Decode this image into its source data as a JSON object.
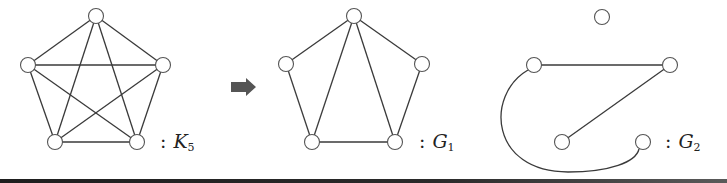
{
  "figure": {
    "graphs": [
      {
        "id": "K5",
        "label": {
          "colon": ":",
          "symbol": "K",
          "subscript": "5"
        },
        "label_pos": [
          160,
          130
        ],
        "nodes": [
          {
            "id": "top",
            "x": 96,
            "y": 16
          },
          {
            "id": "left",
            "x": 28,
            "y": 65
          },
          {
            "id": "right",
            "x": 163,
            "y": 65
          },
          {
            "id": "bottom-left",
            "x": 55,
            "y": 142
          },
          {
            "id": "bottom-right",
            "x": 137,
            "y": 142
          }
        ],
        "edges": [
          [
            "top",
            "left"
          ],
          [
            "top",
            "right"
          ],
          [
            "top",
            "bottom-left"
          ],
          [
            "top",
            "bottom-right"
          ],
          [
            "left",
            "right"
          ],
          [
            "left",
            "bottom-left"
          ],
          [
            "left",
            "bottom-right"
          ],
          [
            "right",
            "bottom-left"
          ],
          [
            "right",
            "bottom-right"
          ],
          [
            "bottom-left",
            "bottom-right"
          ]
        ]
      },
      {
        "id": "G1",
        "label": {
          "colon": ":",
          "symbol": "G",
          "subscript": "1"
        },
        "label_pos": [
          419,
          130
        ],
        "nodes": [
          {
            "id": "top",
            "x": 354,
            "y": 16
          },
          {
            "id": "left",
            "x": 286,
            "y": 64
          },
          {
            "id": "right",
            "x": 422,
            "y": 64
          },
          {
            "id": "bottom-left",
            "x": 312,
            "y": 142
          },
          {
            "id": "bottom-right",
            "x": 395,
            "y": 142
          }
        ],
        "edges": [
          [
            "top",
            "left"
          ],
          [
            "top",
            "right"
          ],
          [
            "top",
            "bottom-left"
          ],
          [
            "top",
            "bottom-right"
          ],
          [
            "left",
            "bottom-left"
          ],
          [
            "right",
            "bottom-right"
          ],
          [
            "bottom-left",
            "bottom-right"
          ]
        ]
      },
      {
        "id": "G2",
        "label": {
          "colon": ":",
          "symbol": "G",
          "subscript": "2"
        },
        "label_pos": [
          665,
          130
        ],
        "nodes": [
          {
            "id": "top",
            "x": 602,
            "y": 17
          },
          {
            "id": "left",
            "x": 534,
            "y": 65
          },
          {
            "id": "right",
            "x": 670,
            "y": 65
          },
          {
            "id": "bottom-left",
            "x": 562,
            "y": 142
          },
          {
            "id": "bottom-right",
            "x": 643,
            "y": 142
          }
        ],
        "edges": [
          [
            "left",
            "right"
          ],
          [
            "right",
            "bottom-left"
          ]
        ],
        "curved_edges": [
          {
            "from": "left",
            "to": "bottom-right",
            "path": "M 528 70 C 485 95, 490 172, 568 172 C 610 172, 636 162, 639 149"
          }
        ]
      }
    ],
    "arrow": {
      "x": 231,
      "y": 78,
      "direction": "right",
      "color": "#555555"
    },
    "node_radius": 7.5,
    "edge_color": "#3a3a3a"
  }
}
